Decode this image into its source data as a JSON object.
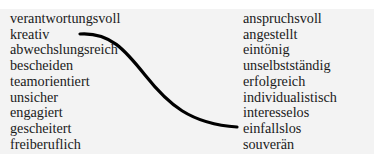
{
  "exercise": {
    "cut_off_heading": "",
    "left_column": [
      "verantwortungsvoll",
      "kreativ",
      "abwechslungsreich",
      "bescheiden",
      "teamorientiert",
      "unsicher",
      "engagiert",
      "gescheitert",
      "freiberuflich"
    ],
    "right_column": [
      "anspruchsvoll",
      "angestellt",
      "eintönig",
      "unselbstständig",
      "erfolgreich",
      "individualistisch",
      "interesselos",
      "einfallslos",
      "souverän"
    ],
    "connection": {
      "from": "kreativ",
      "to": "einfallslos",
      "color": "#000000"
    }
  },
  "colors": {
    "page_background": "#ffffff",
    "box_background": "#f3f3f3",
    "text": "#1a1a1a",
    "line": "#000000"
  }
}
